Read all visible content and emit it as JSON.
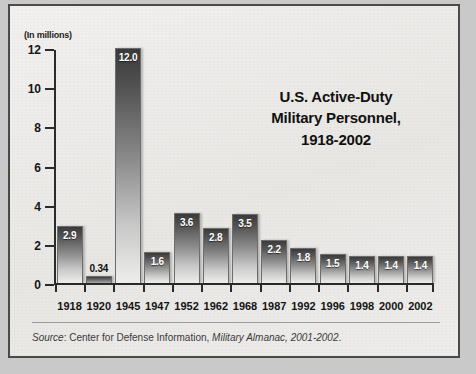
{
  "figure": {
    "units_label": "(In millions)",
    "title_lines": [
      "U.S. Active-Duty",
      "Military Personnel,",
      "1918-2002"
    ],
    "source_prefix": "Source",
    "source_sep": ": ",
    "source_org": "Center for Defense Information, ",
    "source_pub": "Military Almanac, 2001-2002",
    "source_end": "."
  },
  "chart_data": {
    "type": "bar",
    "title": "U.S. Active-Duty Military Personnel, 1918-2002",
    "xlabel": "",
    "ylabel": "(In millions)",
    "ylim": [
      0,
      12
    ],
    "yticks": [
      0,
      2,
      4,
      6,
      8,
      10,
      12
    ],
    "ytick_labels": [
      "0",
      "2",
      "4",
      "6",
      "8",
      "10",
      "12"
    ],
    "grid": false,
    "legend": null,
    "categories": [
      "1918",
      "1920",
      "1945",
      "1947",
      "1952",
      "1962",
      "1968",
      "1987",
      "1992",
      "1996",
      "1998",
      "2000",
      "2002"
    ],
    "values": [
      2.9,
      0.34,
      12.0,
      1.6,
      3.6,
      2.8,
      3.5,
      2.2,
      1.8,
      1.5,
      1.4,
      1.4,
      1.4
    ],
    "value_labels": [
      "2.9",
      "0.34",
      "12.0",
      "1.6",
      "3.6",
      "2.8",
      "3.5",
      "2.2",
      "1.8",
      "1.5",
      "1.4",
      "1.4",
      "1.4"
    ],
    "colors": {
      "bar_top": "#3a3a3a",
      "bar_bottom": "#eeeeec",
      "axis": "#2b2b2b",
      "background": "#ececea"
    }
  }
}
